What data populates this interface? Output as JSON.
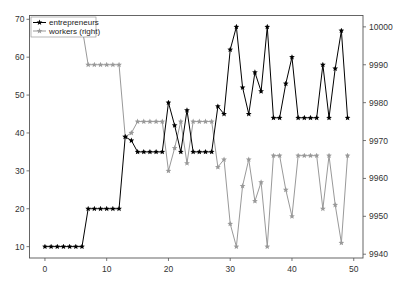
{
  "chart_data": {
    "type": "line",
    "title": "",
    "xlabel": "",
    "ylabel": "",
    "ylabel_right": "",
    "xlim": [
      -2.5,
      51.5
    ],
    "ylim": [
      7,
      71
    ],
    "ylim_right": [
      9939,
      10003
    ],
    "x_ticks": [
      0,
      10,
      20,
      30,
      40,
      50
    ],
    "y_ticks": [
      10,
      20,
      30,
      40,
      50,
      60,
      70
    ],
    "y_ticks_right": [
      9940,
      9950,
      9960,
      9970,
      9980,
      9990,
      10000
    ],
    "legend_position": "upper left",
    "grid": false,
    "x": [
      0,
      1,
      2,
      3,
      4,
      5,
      6,
      7,
      8,
      9,
      10,
      11,
      12,
      13,
      14,
      15,
      16,
      17,
      18,
      19,
      20,
      21,
      22,
      23,
      24,
      25,
      26,
      27,
      28,
      29,
      30,
      31,
      32,
      33,
      34,
      35,
      36,
      37,
      38,
      39,
      40,
      41,
      42,
      43,
      44,
      45,
      46,
      47,
      48,
      49
    ],
    "series": [
      {
        "name": "entrepreneurs",
        "axis": "left",
        "color": "#000000",
        "marker": "star",
        "values": [
          10,
          10,
          10,
          10,
          10,
          10,
          10,
          20,
          20,
          20,
          20,
          20,
          20,
          39,
          38,
          35,
          35,
          35,
          35,
          35,
          48,
          42,
          35,
          46,
          35,
          35,
          35,
          35,
          47,
          45,
          62,
          68,
          52,
          45,
          56,
          51,
          68,
          44,
          44,
          53,
          60,
          44,
          44,
          44,
          44,
          58,
          44,
          57,
          67,
          44
        ]
      },
      {
        "name": "workers (right)",
        "axis": "right",
        "color": "#999999",
        "marker": "star",
        "values": [
          10000,
          10000,
          10000,
          10000,
          10000,
          10000,
          10000,
          9990,
          9990,
          9990,
          9990,
          9990,
          9990,
          9971,
          9972,
          9975,
          9975,
          9975,
          9975,
          9975,
          9962,
          9968,
          9975,
          9964,
          9975,
          9975,
          9975,
          9975,
          9963,
          9965,
          9948,
          9942,
          9958,
          9965,
          9954,
          9959,
          9942,
          9966,
          9966,
          9957,
          9950,
          9966,
          9966,
          9966,
          9966,
          9952,
          9966,
          9953,
          9943,
          9966
        ]
      }
    ]
  },
  "legend": {
    "items": [
      {
        "label": "entrepreneurs",
        "color": "#000000"
      },
      {
        "label": "workers (right)",
        "color": "#999999"
      }
    ]
  }
}
